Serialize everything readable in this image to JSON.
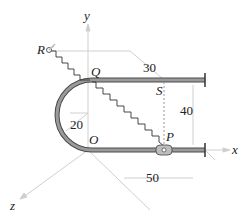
{
  "diagram": {
    "axes": {
      "x": "x",
      "y": "y",
      "z": "z"
    },
    "points": {
      "origin": "O",
      "P": "P",
      "Q": "Q",
      "R": "R",
      "S": "S"
    },
    "dimensions": {
      "rod_length_x": "50",
      "rod_spacing_y": "40",
      "bend_radius": "20",
      "depth_z": "30"
    },
    "colors": {
      "rod": "#8a8a8a",
      "rod_outline": "#4a4a4a",
      "axis": "#c8c8c8",
      "spring": "#333333",
      "label": "#222222"
    }
  }
}
